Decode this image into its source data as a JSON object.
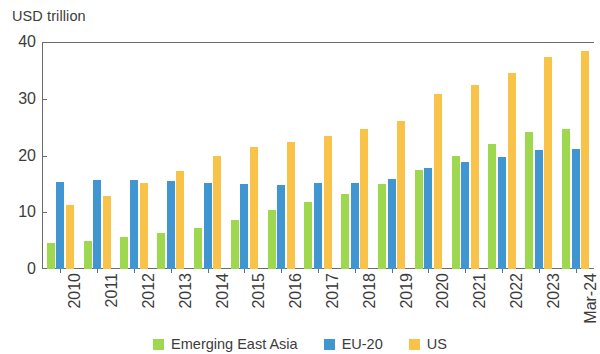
{
  "chart_data": {
    "type": "bar",
    "title": "",
    "subtitle": "",
    "xlabel": "",
    "ylabel": "USD trillion",
    "ylim": [
      0,
      40
    ],
    "ytick_labels": [
      "40",
      "30",
      "20",
      "10",
      "0"
    ],
    "ytick_values": [
      40,
      30,
      20,
      10,
      0
    ],
    "grid": false,
    "legend_position": "bottom",
    "categories": [
      "2010",
      "2011",
      "2012",
      "2013",
      "2014",
      "2015",
      "2016",
      "2017",
      "2018",
      "2019",
      "2020",
      "2021",
      "2022",
      "2023",
      "Mar-24"
    ],
    "series": [
      {
        "name": "Emerging East Asia",
        "color": "#9ed84f",
        "values": [
          4.6,
          4.9,
          5.6,
          6.4,
          7.2,
          8.6,
          10.4,
          11.8,
          13.2,
          14.9,
          17.5,
          19.9,
          22.1,
          24.2,
          24.7
        ]
      },
      {
        "name": "EU-20",
        "color": "#3f96d1",
        "values": [
          15.3,
          15.6,
          15.6,
          15.5,
          15.2,
          14.9,
          14.8,
          15.1,
          15.2,
          15.9,
          17.8,
          18.8,
          19.7,
          20.9,
          21.2
        ]
      },
      {
        "name": "US",
        "color": "#f9c349",
        "values": [
          11.3,
          12.8,
          15.1,
          17.2,
          19.9,
          21.5,
          22.3,
          23.4,
          24.6,
          26.0,
          30.9,
          32.5,
          34.6,
          37.4,
          38.4
        ]
      }
    ]
  },
  "axis": {
    "y_unit_title": "USD trillion"
  },
  "legend": {
    "items": [
      {
        "label": "Emerging East Asia",
        "color": "#9ed84f",
        "icon": "legend-swatch-square"
      },
      {
        "label": "EU-20",
        "color": "#3f96d1",
        "icon": "legend-swatch-square"
      },
      {
        "label": "US",
        "color": "#f9c349",
        "icon": "legend-swatch-square"
      }
    ]
  }
}
